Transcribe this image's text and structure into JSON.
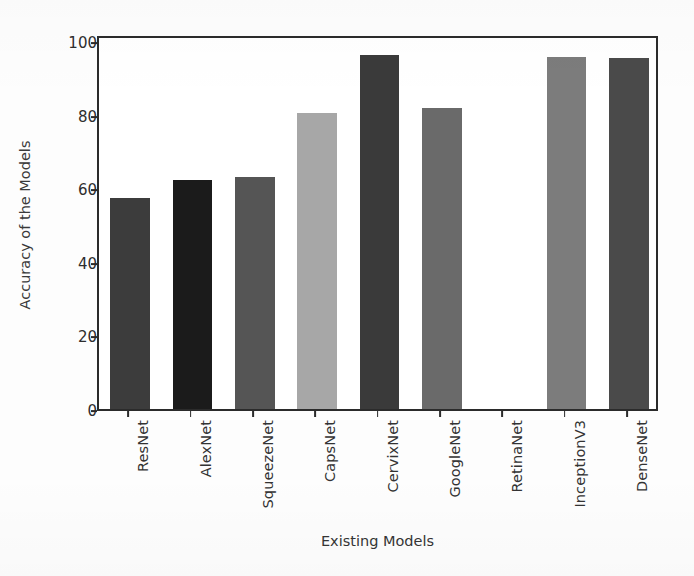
{
  "chart_data": {
    "type": "bar",
    "title": "",
    "xlabel": "Existing Models",
    "ylabel": "Accuracy of the Models",
    "categories": [
      "ResNet",
      "AlexNet",
      "SqueezeNet",
      "CapsNet",
      "CervixNet",
      "GoogleNet",
      "RetinaNet",
      "InceptionV3",
      "DenseNet"
    ],
    "values": [
      57.5,
      62.2,
      63.2,
      80.5,
      96.3,
      82.0,
      0,
      95.7,
      95.6
    ],
    "bar_colors": [
      "#3c3c3c",
      "#1b1b1b",
      "#555555",
      "#a7a7a7",
      "#3a3a3a",
      "#6a6a6a",
      "#ffffff",
      "#7c7c7c",
      "#4a4a4a"
    ],
    "ylim": [
      0,
      102
    ],
    "yticks": [
      0,
      20,
      40,
      60,
      80,
      100
    ],
    "ytick_labels": [
      "0",
      "20",
      "40",
      "60",
      "80",
      "100"
    ],
    "grid": false,
    "legend": "none",
    "axis_color": "#2b2b2b",
    "background": "#ffffff"
  }
}
